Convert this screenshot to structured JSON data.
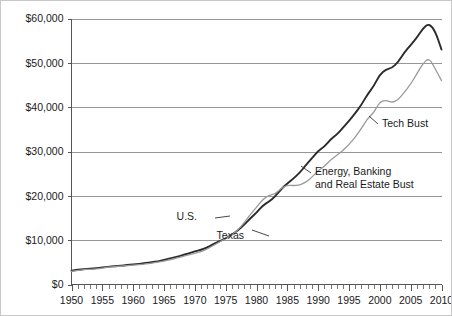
{
  "chart_data": {
    "type": "line",
    "title": "",
    "subtitle": "",
    "xlabel": "",
    "ylabel": "",
    "xlim": [
      1950,
      2010
    ],
    "ylim": [
      0,
      60000
    ],
    "grid": true,
    "legend_position": "inline-annotation",
    "x_tick_labels": [
      "1950",
      "1955",
      "1960",
      "1965",
      "1970",
      "1975",
      "1980",
      "1985",
      "1990",
      "1995",
      "2000",
      "2005",
      "2010"
    ],
    "x_tick_values": [
      1950,
      1955,
      1960,
      1965,
      1970,
      1975,
      1980,
      1985,
      1990,
      1995,
      2000,
      2005,
      2010
    ],
    "x_minor_tick_step": 1,
    "y_tick_labels": [
      "$0",
      "$10,000",
      "$20,000",
      "$30,000",
      "$40,000",
      "$50,000",
      "$60,000"
    ],
    "y_tick_values": [
      0,
      10000,
      20000,
      30000,
      40000,
      50000,
      60000
    ],
    "x": [
      1950,
      1951,
      1952,
      1953,
      1954,
      1955,
      1956,
      1957,
      1958,
      1959,
      1960,
      1961,
      1962,
      1963,
      1964,
      1965,
      1966,
      1967,
      1968,
      1969,
      1970,
      1971,
      1972,
      1973,
      1974,
      1975,
      1976,
      1977,
      1978,
      1979,
      1980,
      1981,
      1982,
      1983,
      1984,
      1985,
      1986,
      1987,
      1988,
      1989,
      1990,
      1991,
      1992,
      1993,
      1994,
      1995,
      1996,
      1997,
      1998,
      1999,
      2000,
      2001,
      2002,
      2003,
      2004,
      2005,
      2006,
      2007,
      2008,
      2009,
      2010
    ],
    "series": [
      {
        "name": "U.S.",
        "color": "#2b2b2b",
        "width": 1.9,
        "values": [
          3100,
          3300,
          3450,
          3600,
          3650,
          3850,
          4000,
          4150,
          4200,
          4400,
          4550,
          4650,
          4850,
          5000,
          5250,
          5550,
          5900,
          6200,
          6600,
          7050,
          7450,
          7800,
          8350,
          9100,
          9750,
          10400,
          11250,
          12200,
          13500,
          14900,
          16200,
          17800,
          18700,
          19800,
          21500,
          22800,
          23900,
          25200,
          26900,
          28500,
          30100,
          31100,
          32700,
          33800,
          35300,
          36900,
          38600,
          40500,
          42900,
          44700,
          47400,
          48500,
          48900,
          50200,
          52400,
          54000,
          55700,
          57800,
          58900,
          57100,
          53000
        ],
        "final_value": 53000,
        "start_value": 3100
      },
      {
        "name": "Texas",
        "color": "#9a9a9a",
        "width": 1.3,
        "values": [
          2950,
          3150,
          3350,
          3450,
          3500,
          3700,
          3900,
          4050,
          4100,
          4250,
          4400,
          4450,
          4650,
          4800,
          5050,
          5300,
          5600,
          5900,
          6300,
          6700,
          7050,
          7400,
          8000,
          8800,
          9600,
          10350,
          11200,
          12300,
          13900,
          15800,
          17400,
          19200,
          20100,
          20400,
          21700,
          22400,
          22300,
          22400,
          23100,
          24200,
          25700,
          26600,
          28100,
          29100,
          30200,
          31600,
          33200,
          35200,
          37400,
          38700,
          41200,
          41600,
          41000,
          41700,
          43400,
          45200,
          47500,
          49900,
          51100,
          48600,
          46000
        ],
        "final_value": 46000,
        "start_value": 2950
      }
    ],
    "annotations": [
      {
        "id": "us-label",
        "text": "U.S.",
        "series": "U.S.",
        "x_px": 196,
        "y_px": 219
      },
      {
        "id": "texas-label",
        "text": "Texas",
        "series": "Texas",
        "x_px": 243,
        "y_px": 238
      },
      {
        "id": "tech-bust-label",
        "text": "Tech Bust",
        "series": "Texas",
        "x_px": 381,
        "y_px": 126
      },
      {
        "id": "energy-bust-label-line1",
        "text": "Energy, Banking",
        "series": "Texas",
        "x_px": 314,
        "y_px": 174
      },
      {
        "id": "energy-bust-label-line2",
        "text": "and Real Estate Bust",
        "series": "Texas",
        "x_px": 314,
        "y_px": 187
      }
    ],
    "colors": {
      "us_line": "#2b2b2b",
      "texas_line": "#9a9a9a",
      "gridline": "#8c8c8c",
      "axis": "#555555",
      "text": "#1a1a1a",
      "background": "#ffffff",
      "border": "#c8c8c8"
    }
  }
}
